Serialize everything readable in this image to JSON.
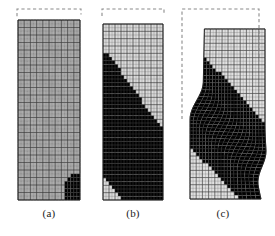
{
  "figure": {
    "background_color": "#ffffff",
    "panel_count": 3
  },
  "panels": [
    {
      "id": "panel-a",
      "caption": "(a)",
      "stage_label": "uniform deformation",
      "x": 18,
      "y": 20,
      "width": 62,
      "height": 180,
      "caption_x": 18,
      "caption_y": 207,
      "caption_width": 62,
      "mesh": {
        "columns": 10,
        "rows": 24,
        "subdivisions_per_cell": 2,
        "fine_line_color": "#6f6f6f",
        "coarse_line_color": "#2c2c2c",
        "border_color": "#1c1c1c"
      },
      "field": {
        "base_gray": "#9e9e9e",
        "min_gray": "#b4b4b4",
        "max_gray": "#1a1a1a",
        "band_present": false,
        "hotspot": {
          "x_frac": 0.95,
          "y_frac": 0.975,
          "intensity": 0.95
        }
      },
      "reference_outline": {
        "visible": true,
        "top": 9,
        "left_offset": -1,
        "right_offset": 1,
        "style": "dashed",
        "color": "#8a8a8a"
      },
      "deformation": {
        "top_shortening_px": 11,
        "shear_offset_px": 0,
        "distorted": false
      }
    },
    {
      "id": "panel-b",
      "caption": "(b)",
      "stage_label": "incipient shear band",
      "x": 103,
      "y": 24,
      "width": 60,
      "height": 176,
      "caption_x": 103,
      "caption_y": 207,
      "caption_width": 60,
      "mesh": {
        "columns": 10,
        "rows": 24,
        "subdivisions_per_cell": 2,
        "fine_line_color": "#6f6f6f",
        "coarse_line_color": "#2c2c2c",
        "border_color": "#1c1c1c"
      },
      "field": {
        "base_gray": "#d2d2d2",
        "min_gray": "#e2e2e2",
        "max_gray": "#2a2a2a",
        "band_present": true,
        "band": {
          "start_x_frac": 0.02,
          "start_y_frac": 0.5,
          "end_x_frac": 0.86,
          "end_y_frac": 0.9,
          "width_frac": 0.2,
          "diffuse": true,
          "peak_gray": "#6a6a6a"
        },
        "hotspot": {
          "x_frac": 0.96,
          "y_frac": 0.975,
          "intensity": 0.9
        }
      },
      "reference_outline": {
        "visible": true,
        "top": 9,
        "left_offset": -1,
        "right_offset": 1,
        "style": "dashed",
        "color": "#8a8a8a"
      },
      "deformation": {
        "top_shortening_px": 15,
        "shear_offset_px": 0,
        "distorted": false
      }
    },
    {
      "id": "panel-c",
      "caption": "(c)",
      "stage_label": "fully localized shear band",
      "x": 196,
      "y": 28,
      "width": 62,
      "height": 172,
      "caption_x": 192,
      "caption_y": 207,
      "caption_width": 62,
      "mesh": {
        "columns": 10,
        "rows": 24,
        "subdivisions_per_cell": 2,
        "fine_line_color": "#6f6f6f",
        "coarse_line_color": "#2c2c2c",
        "border_color": "#1c1c1c"
      },
      "field": {
        "base_gray": "#d8d8d8",
        "min_gray": "#e8e8e8",
        "max_gray": "#141414",
        "band_present": true,
        "band": {
          "start_x_frac": -0.06,
          "start_y_frac": 0.4,
          "end_x_frac": 1.02,
          "end_y_frac": 0.82,
          "width_frac": 0.12,
          "diffuse": false,
          "peak_gray": "#1e1e1e"
        },
        "hotspot": {
          "x_frac": 0.97,
          "y_frac": 0.8,
          "intensity": 1.0
        }
      },
      "reference_outline": {
        "visible": true,
        "top": 9,
        "left_offset": -14,
        "right_offset": 1,
        "style": "dashed",
        "color": "#8a8a8a"
      },
      "deformation": {
        "top_shortening_px": 19,
        "shear_offset_px": 13,
        "distorted": true,
        "upper_block_shift_x": -6,
        "lower_block_shift_x": 7,
        "bottom_right_bulge_px": 9
      }
    }
  ],
  "colorbar": {
    "visible": false,
    "description": "grayscale intensity denotes accumulated plastic shear strain; dark = high"
  }
}
